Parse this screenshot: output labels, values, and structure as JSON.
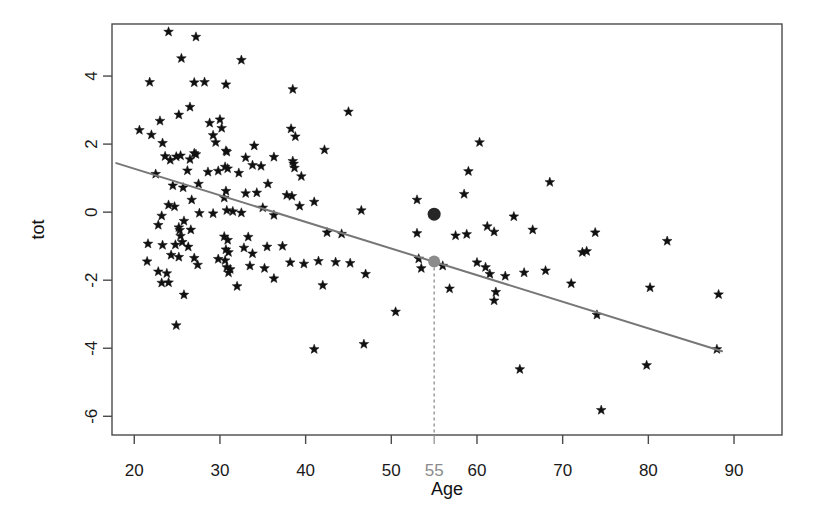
{
  "chart_data": {
    "type": "scatter",
    "title": "",
    "xlabel": "Age",
    "ylabel": "tot",
    "xlim": [
      17.4,
      95.6
    ],
    "ylim": [
      -6.55,
      5.53
    ],
    "grid": false,
    "legend": "none",
    "x_ticks": [
      20,
      30,
      40,
      50,
      60,
      70,
      80,
      90
    ],
    "x_tick_labels": [
      "20",
      "30",
      "40",
      "50",
      "60",
      "70",
      "80",
      "90"
    ],
    "y_ticks": [
      4,
      2,
      0,
      -2,
      -4,
      -6
    ],
    "y_tick_labels": [
      "4",
      "2",
      "0",
      "-2",
      "-4",
      "-6"
    ],
    "extra_x_tick": 55,
    "extra_x_tick_label": "55",
    "point_marker": "star",
    "point_color": "#111111",
    "regression_line": {
      "slope": -0.0782,
      "intercept": 2.84,
      "x_start": 17.9,
      "x_end": 88.6,
      "color": "#777777",
      "width": 2
    },
    "highlight_points": [
      {
        "name": "observed-point",
        "x": 55,
        "y": -0.06,
        "color": "#262626",
        "radius": 6.5
      },
      {
        "name": "fitted-point",
        "x": 55,
        "y": -1.45,
        "color": "#8c8c8c",
        "radius": 6.0
      }
    ],
    "reference_line": {
      "name": "vertical-dashed-guide",
      "x": 55,
      "y_top": -1.45,
      "y_bottom": -6.55,
      "style": "dashed",
      "color": "#8c8c8c"
    },
    "points": [
      [
        24.0,
        5.3
      ],
      [
        27.2,
        5.15
      ],
      [
        25.5,
        4.52
      ],
      [
        32.5,
        4.47
      ],
      [
        21.8,
        3.82
      ],
      [
        27.0,
        3.81
      ],
      [
        28.2,
        3.82
      ],
      [
        30.7,
        3.75
      ],
      [
        38.5,
        3.61
      ],
      [
        45.0,
        2.95
      ],
      [
        26.5,
        3.09
      ],
      [
        25.2,
        2.86
      ],
      [
        23.0,
        2.68
      ],
      [
        28.8,
        2.62
      ],
      [
        30.0,
        2.72
      ],
      [
        30.2,
        2.47
      ],
      [
        38.3,
        2.45
      ],
      [
        20.6,
        2.41
      ],
      [
        29.2,
        2.26
      ],
      [
        38.8,
        2.22
      ],
      [
        22.0,
        2.27
      ],
      [
        29.5,
        2.05
      ],
      [
        23.3,
        2.03
      ],
      [
        34.0,
        1.95
      ],
      [
        42.2,
        1.83
      ],
      [
        30.7,
        1.8
      ],
      [
        30.8,
        1.77
      ],
      [
        23.6,
        1.64
      ],
      [
        24.9,
        1.63
      ],
      [
        25.4,
        1.66
      ],
      [
        27.0,
        1.73
      ],
      [
        33.0,
        1.6
      ],
      [
        36.3,
        1.62
      ],
      [
        27.2,
        1.7
      ],
      [
        38.5,
        1.5
      ],
      [
        38.6,
        1.42
      ],
      [
        24.2,
        1.53
      ],
      [
        26.5,
        1.55
      ],
      [
        38.7,
        1.3
      ],
      [
        33.8,
        1.38
      ],
      [
        34.8,
        1.35
      ],
      [
        30.6,
        1.33
      ],
      [
        30.9,
        1.28
      ],
      [
        26.2,
        1.22
      ],
      [
        28.6,
        1.18
      ],
      [
        29.8,
        1.21
      ],
      [
        32.2,
        1.15
      ],
      [
        22.5,
        1.12
      ],
      [
        39.5,
        1.05
      ],
      [
        27.5,
        0.83
      ],
      [
        35.6,
        0.83
      ],
      [
        24.5,
        0.78
      ],
      [
        25.7,
        0.72
      ],
      [
        30.7,
        0.62
      ],
      [
        33.0,
        0.55
      ],
      [
        34.3,
        0.57
      ],
      [
        37.8,
        0.5
      ],
      [
        38.4,
        0.47
      ],
      [
        30.5,
        0.42
      ],
      [
        26.7,
        0.36
      ],
      [
        41.0,
        0.3
      ],
      [
        24.0,
        0.21
      ],
      [
        24.7,
        0.16
      ],
      [
        39.3,
        0.18
      ],
      [
        35.0,
        0.13
      ],
      [
        30.8,
        0.05
      ],
      [
        31.5,
        0.02
      ],
      [
        27.6,
        -0.03
      ],
      [
        29.2,
        -0.04
      ],
      [
        32.5,
        -0.02
      ],
      [
        36.3,
        -0.09
      ],
      [
        23.2,
        -0.11
      ],
      [
        46.5,
        0.05
      ],
      [
        25.8,
        -0.26
      ],
      [
        22.8,
        -0.38
      ],
      [
        25.2,
        -0.45
      ],
      [
        25.3,
        -0.53
      ],
      [
        26.6,
        -0.52
      ],
      [
        42.5,
        -0.6
      ],
      [
        44.2,
        -0.64
      ],
      [
        25.4,
        -0.7
      ],
      [
        30.5,
        -0.72
      ],
      [
        33.3,
        -0.73
      ],
      [
        30.9,
        -0.82
      ],
      [
        25.6,
        -0.88
      ],
      [
        21.6,
        -0.93
      ],
      [
        23.3,
        -0.97
      ],
      [
        24.8,
        -0.96
      ],
      [
        26.3,
        -1.02
      ],
      [
        32.8,
        -1.05
      ],
      [
        35.5,
        -1.02
      ],
      [
        37.3,
        -1.0
      ],
      [
        30.7,
        -1.1
      ],
      [
        31.0,
        -1.18
      ],
      [
        33.8,
        -1.22
      ],
      [
        24.3,
        -1.26
      ],
      [
        25.2,
        -1.32
      ],
      [
        27.0,
        -1.35
      ],
      [
        29.8,
        -1.38
      ],
      [
        30.6,
        -1.42
      ],
      [
        21.5,
        -1.45
      ],
      [
        38.2,
        -1.48
      ],
      [
        39.8,
        -1.52
      ],
      [
        41.5,
        -1.44
      ],
      [
        43.5,
        -1.47
      ],
      [
        45.2,
        -1.5
      ],
      [
        27.4,
        -1.55
      ],
      [
        30.8,
        -1.62
      ],
      [
        31.2,
        -1.68
      ],
      [
        33.5,
        -1.58
      ],
      [
        35.2,
        -1.65
      ],
      [
        22.8,
        -1.75
      ],
      [
        23.8,
        -1.8
      ],
      [
        31.0,
        -1.78
      ],
      [
        36.3,
        -1.95
      ],
      [
        47.0,
        -1.82
      ],
      [
        23.2,
        -2.08
      ],
      [
        24.0,
        -2.07
      ],
      [
        32.0,
        -2.18
      ],
      [
        42.0,
        -2.15
      ],
      [
        25.8,
        -2.43
      ],
      [
        24.9,
        -3.33
      ],
      [
        41.0,
        -4.03
      ],
      [
        46.8,
        -3.88
      ],
      [
        50.5,
        -2.93
      ],
      [
        53.0,
        -0.62
      ],
      [
        53.2,
        -1.37
      ],
      [
        53.5,
        -1.65
      ],
      [
        56.0,
        -1.58
      ],
      [
        53.0,
        0.36
      ],
      [
        57.5,
        -0.69
      ],
      [
        58.8,
        -0.65
      ],
      [
        56.8,
        -2.25
      ],
      [
        60.0,
        -1.48
      ],
      [
        61.0,
        -1.62
      ],
      [
        61.5,
        -1.82
      ],
      [
        62.2,
        -2.35
      ],
      [
        63.3,
        -1.88
      ],
      [
        62.0,
        -2.6
      ],
      [
        59.0,
        1.2
      ],
      [
        60.3,
        2.05
      ],
      [
        58.5,
        0.53
      ],
      [
        61.2,
        -0.42
      ],
      [
        62.0,
        -0.58
      ],
      [
        64.3,
        -0.13
      ],
      [
        65.0,
        -4.62
      ],
      [
        65.5,
        -1.78
      ],
      [
        68.0,
        -1.72
      ],
      [
        71.0,
        -2.1
      ],
      [
        72.3,
        -1.18
      ],
      [
        72.8,
        -1.15
      ],
      [
        68.5,
        0.88
      ],
      [
        74.0,
        -3.02
      ],
      [
        74.5,
        -5.82
      ],
      [
        79.8,
        -4.5
      ],
      [
        82.2,
        -0.85
      ],
      [
        80.2,
        -2.22
      ],
      [
        88.0,
        -4.03
      ],
      [
        88.2,
        -2.42
      ],
      [
        73.8,
        -0.6
      ],
      [
        66.5,
        -0.52
      ]
    ]
  }
}
